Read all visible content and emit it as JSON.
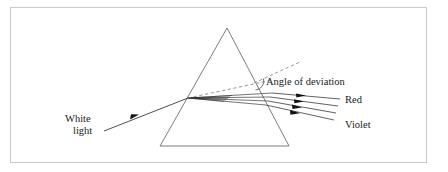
{
  "figure": {
    "frame": {
      "x": 10,
      "y": 7,
      "width": 417,
      "height": 156,
      "stroke": "#c9c9c9",
      "fill": "#ffffff"
    },
    "background_color": "#ffffff",
    "line_color": "#555555",
    "ray_color": "#3a3a3a",
    "dash_color": "#8a8a8a",
    "text_color": "#1a1a1a",
    "prism": {
      "name": "triangular-prism",
      "apex": {
        "x": 227,
        "y": 28
      },
      "base_left": {
        "x": 160,
        "y": 146
      },
      "base_right": {
        "x": 289,
        "y": 146
      },
      "stroke": "#6e6e6e"
    },
    "incident_ray": {
      "name": "incident-white-light-ray",
      "start": {
        "x": 104,
        "y": 131
      },
      "end": {
        "x": 188,
        "y": 98
      },
      "arrow_at": {
        "x": 133,
        "y": 117
      }
    },
    "entry_point": {
      "x": 188,
      "y": 98
    },
    "labels": {
      "white_light_line1": "White",
      "white_light_line2": "light",
      "angle_of_deviation": "Angle of deviation",
      "red": "Red",
      "violet": "Violet"
    },
    "label_positions": {
      "white_light_line1": {
        "x": 65,
        "y": 122
      },
      "white_light_line2": {
        "x": 72,
        "y": 134
      },
      "angle_of_deviation": {
        "x": 265,
        "y": 84
      },
      "red": {
        "x": 345,
        "y": 102
      },
      "violet": {
        "x": 345,
        "y": 127
      }
    },
    "dashed_lines": [
      {
        "name": "undeviated-path-dashed-line",
        "start": {
          "x": 188,
          "y": 98
        },
        "end": {
          "x": 268,
          "y": 81
        }
      },
      {
        "name": "deviation-reference-dashed-line",
        "start": {
          "x": 255,
          "y": 82
        },
        "end": {
          "x": 300,
          "y": 62
        }
      }
    ],
    "deviation_arc": {
      "name": "angle-of-deviation-arc",
      "center": {
        "x": 258,
        "y": 82
      },
      "radius": 9
    },
    "dispersed_rays": [
      {
        "name": "dispersed-ray-red",
        "color_label": "Red",
        "exit": {
          "x": 272,
          "y": 93
        },
        "end": {
          "x": 340,
          "y": 99
        },
        "arrow_at": {
          "x": 300,
          "y": 95
        }
      },
      {
        "name": "dispersed-ray-2",
        "color_label": "",
        "exit": {
          "x": 270,
          "y": 97
        },
        "end": {
          "x": 338,
          "y": 106
        },
        "arrow_at": {
          "x": 299,
          "y": 101
        }
      },
      {
        "name": "dispersed-ray-3",
        "color_label": "",
        "exit": {
          "x": 268,
          "y": 101
        },
        "end": {
          "x": 336,
          "y": 113
        },
        "arrow_at": {
          "x": 297,
          "y": 107
        }
      },
      {
        "name": "dispersed-ray-violet",
        "color_label": "Violet",
        "exit": {
          "x": 266,
          "y": 105
        },
        "end": {
          "x": 334,
          "y": 120
        },
        "arrow_at": {
          "x": 295,
          "y": 113
        }
      }
    ],
    "internal_rays_count": 4,
    "internal_ray_fan": {
      "from": {
        "x": 188,
        "y": 98
      },
      "to_points": [
        {
          "x": 272,
          "y": 93
        },
        {
          "x": 270,
          "y": 97
        },
        {
          "x": 268,
          "y": 101
        },
        {
          "x": 266,
          "y": 105
        }
      ]
    }
  }
}
